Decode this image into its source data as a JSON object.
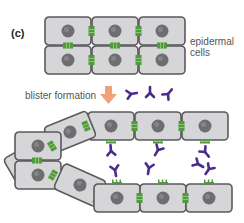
{
  "figure": {
    "panel_label": "(c)",
    "labels": {
      "epidermal_cells_line1": "epidermal",
      "epidermal_cells_line2": "cells",
      "blister_formation": "blister formation"
    },
    "colors": {
      "cell_fill": "#d6d6d8",
      "cell_border": "#5a5a5c",
      "nucleus": "#6e6e70",
      "junction": "#4f9a3a",
      "antibody": "#4b2c8a",
      "arrow": "#f2a07a",
      "text": "#555555"
    },
    "components": [
      "intact epidermal cell sheet (2 rows x 3 cells)",
      "desmosome junctions (green)",
      "autoantibodies (purple)",
      "separated cell layers after blister formation"
    ]
  }
}
